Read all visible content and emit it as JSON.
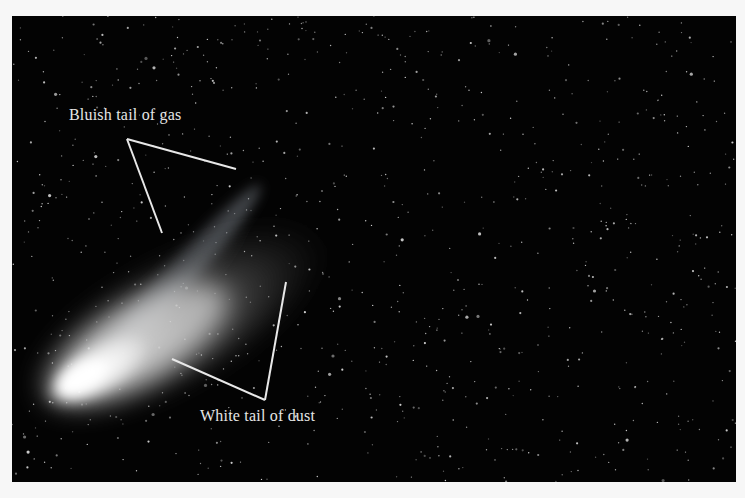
{
  "figure": {
    "background_color": "#030303",
    "page_color": "#f7f7f7",
    "labels": [
      {
        "id": "gas-tail",
        "text": "Bluish tail of gas"
      },
      {
        "id": "dust-tail",
        "text": "White tail of dust"
      }
    ]
  }
}
